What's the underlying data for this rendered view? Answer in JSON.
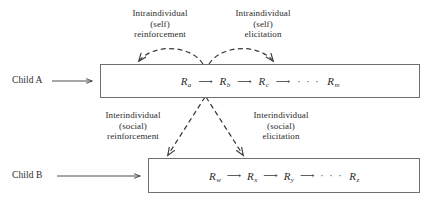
{
  "diagram": {
    "stroke_color": "#6f6f6f",
    "text_color": "#2b2b2b"
  },
  "annotations": {
    "top_left": {
      "line1": "Intraindividual",
      "line2": "(self)",
      "line3": "reinforcement"
    },
    "top_right": {
      "line1": "Intraindividual",
      "line2": "(self)",
      "line3": "elicitation"
    },
    "middle_left": {
      "line1": "Interindividual",
      "line2": "(social)",
      "line3": "reinforcement"
    },
    "middle_right": {
      "line1": "Interindividual",
      "line2": "(social)",
      "line3": "elicitation"
    }
  },
  "rows": {
    "child_a": {
      "actor_label": "Child A",
      "responses": [
        {
          "symbol": "R",
          "subscript": "a"
        },
        {
          "symbol": "R",
          "subscript": "b"
        },
        {
          "symbol": "R",
          "subscript": "c"
        },
        {
          "symbol": "R",
          "subscript": "m"
        }
      ],
      "ellipsis": "· · ·",
      "arrow": "⟶"
    },
    "child_b": {
      "actor_label": "Child B",
      "responses": [
        {
          "symbol": "R",
          "subscript": "w"
        },
        {
          "symbol": "R",
          "subscript": "x"
        },
        {
          "symbol": "R",
          "subscript": "y"
        },
        {
          "symbol": "R",
          "subscript": "z"
        }
      ],
      "ellipsis": "· · ·",
      "arrow": "⟶"
    }
  },
  "connectors": {
    "entry_arrow_a": "⟶",
    "entry_arrow_b": "⟶",
    "self_reinforcement_arc": "dashed-arc-left",
    "self_elicitation_arc": "dashed-arc-right",
    "social_reinforcement_line": "dashed-diagonal-left",
    "social_elicitation_line": "dashed-diagonal-right"
  }
}
